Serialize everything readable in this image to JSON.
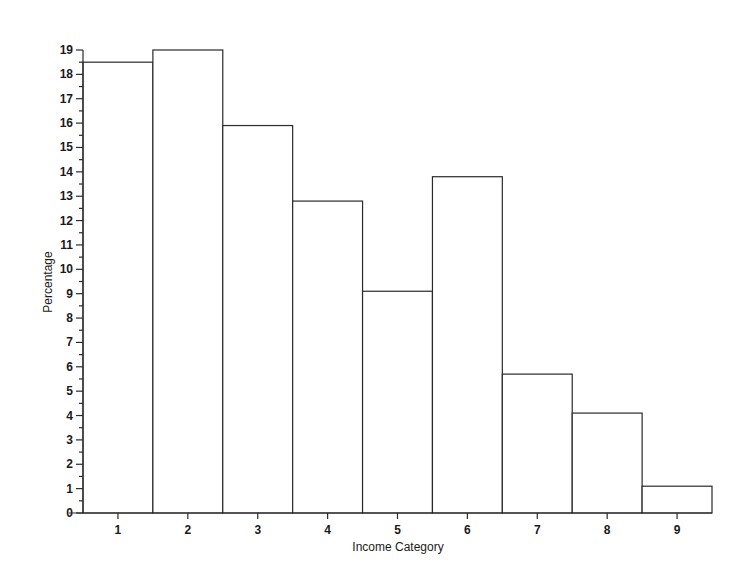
{
  "chart_data": {
    "type": "bar",
    "title": "",
    "xlabel": "Income Category",
    "ylabel": "Percentage",
    "categories": [
      "1",
      "2",
      "3",
      "4",
      "5",
      "6",
      "7",
      "8",
      "9"
    ],
    "values": [
      18.5,
      19.0,
      15.9,
      12.8,
      9.1,
      13.8,
      5.7,
      4.1,
      1.1
    ],
    "ylim": [
      0,
      19
    ],
    "yticks": [
      0,
      1,
      2,
      3,
      4,
      5,
      6,
      7,
      8,
      9,
      10,
      11,
      12,
      13,
      14,
      15,
      16,
      17,
      18,
      19
    ],
    "minor_tick_step": 0.5,
    "grid": false,
    "legend": null,
    "bar_fill": "#ffffff",
    "bar_stroke": "#2a2a2a"
  }
}
